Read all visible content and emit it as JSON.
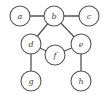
{
  "diagram": {
    "type": "undirected-graph",
    "colors": {
      "stroke": "#555555",
      "fill": "#ffffff",
      "label": "#444444"
    },
    "node_radius": 10,
    "nodes": [
      {
        "id": "a",
        "label": "a",
        "x": 20,
        "y": 16
      },
      {
        "id": "b",
        "label": "b",
        "x": 54,
        "y": 16
      },
      {
        "id": "c",
        "label": "c",
        "x": 89,
        "y": 16
      },
      {
        "id": "d",
        "label": "d",
        "x": 31,
        "y": 44
      },
      {
        "id": "e",
        "label": "e",
        "x": 81,
        "y": 44
      },
      {
        "id": "f",
        "label": "f",
        "x": 55,
        "y": 55
      },
      {
        "id": "g",
        "label": "g",
        "x": 31,
        "y": 81
      },
      {
        "id": "h",
        "label": "h",
        "x": 81,
        "y": 81
      }
    ],
    "edges": [
      [
        "a",
        "b"
      ],
      [
        "b",
        "c"
      ],
      [
        "b",
        "d"
      ],
      [
        "b",
        "e"
      ],
      [
        "d",
        "f"
      ],
      [
        "f",
        "e"
      ],
      [
        "d",
        "g"
      ],
      [
        "e",
        "h"
      ]
    ]
  }
}
